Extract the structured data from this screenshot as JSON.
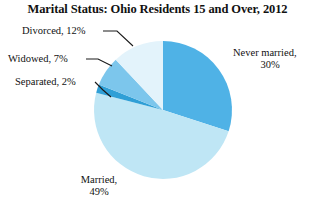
{
  "chart_data": {
    "type": "pie",
    "title": "Marital Status: Ohio Residents 15 and Over, 2012",
    "xlabel": "",
    "ylabel": "",
    "legend_position": "none",
    "grid": false,
    "start_angle_deg": 0,
    "direction": "clockwise",
    "categories": [
      "Never married",
      "Married",
      "Separated",
      "Widowed",
      "Divorced"
    ],
    "values": [
      30,
      49,
      2,
      7,
      12
    ],
    "unit": "percent",
    "slices": [
      {
        "name": "Never married",
        "value": 30,
        "value_label": "30%",
        "color": "#4FB2E6",
        "label_line1": "Never married,",
        "label_line2": "30%",
        "has_leader_line": false
      },
      {
        "name": "Married",
        "value": 49,
        "value_label": "49%",
        "color": "#BFE6F5",
        "label_line1": "Married,",
        "label_line2": "49%",
        "has_leader_line": false
      },
      {
        "name": "Separated",
        "value": 2,
        "value_label": "2%",
        "color": "#2F9FD6",
        "label_line1": "Separated, 2%",
        "label_line2": "",
        "has_leader_line": true
      },
      {
        "name": "Widowed",
        "value": 7,
        "value_label": "7%",
        "color": "#7CC6EC",
        "label_line1": "Widowed, 7%",
        "label_line2": "",
        "has_leader_line": true
      },
      {
        "name": "Divorced",
        "value": 12,
        "value_label": "12%",
        "color": "#E3F3FB",
        "label_line1": "Divorced, 12%",
        "label_line2": "",
        "has_leader_line": true
      }
    ]
  },
  "title": {
    "text": "Marital Status: Ohio Residents 15 and Over, 2012"
  },
  "labels": {
    "divorced": "Divorced, 12%",
    "widowed": "Widowed, 7%",
    "separated": "Separated, 2%",
    "never_married_line1": "Never married,",
    "never_married_line2": "30%",
    "married_line1": "Married,",
    "married_line2": "49%"
  },
  "colors": {
    "never_married": "#4FB2E6",
    "married": "#BFE6F5",
    "separated": "#2F9FD6",
    "widowed": "#7CC6EC",
    "divorced": "#E3F3FB",
    "leader_line": "#1a1a1a",
    "background": "#ffffff",
    "text": "#111111"
  }
}
